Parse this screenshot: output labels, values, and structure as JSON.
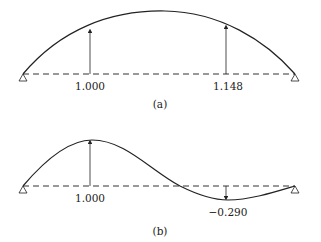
{
  "panel_a": {
    "caption": "(a)",
    "values": [
      "1.000",
      "1.148"
    ]
  },
  "panel_b": {
    "caption": "(b)",
    "values": [
      "1.000",
      "−0.290"
    ]
  },
  "colors": {
    "line": "#222222"
  }
}
